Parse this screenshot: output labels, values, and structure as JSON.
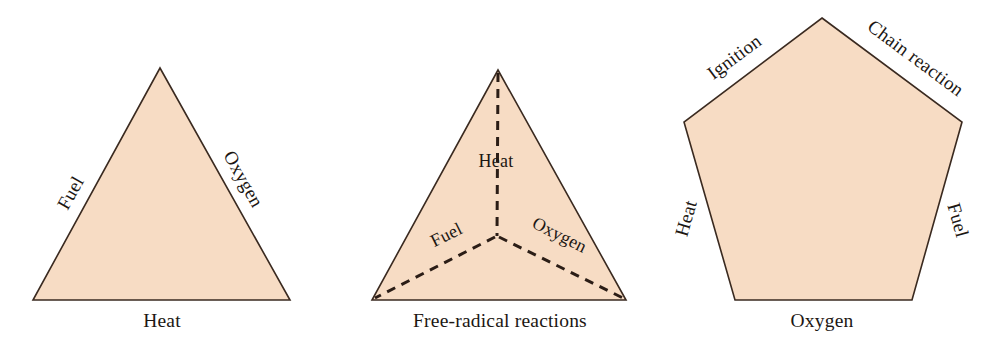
{
  "figure": {
    "background_color": "#ffffff",
    "shape_fill_color": "#f7dcc4",
    "shape_stroke_color": "#3a2a20",
    "label_text_color": "#1c1713",
    "dash_stroke_color": "#2b1d16"
  },
  "diagrams": [
    {
      "id": "fire-triangle",
      "shape": "triangle",
      "labels": {
        "left_edge": "Fuel",
        "right_edge": "Oxygen",
        "bottom": "Heat"
      }
    },
    {
      "id": "fire-tetrahedron",
      "shape": "triangle-with-inner-dashes",
      "labels": {
        "top_inner": "Heat",
        "left_inner": "Fuel",
        "right_inner": "Oxygen",
        "bottom": "Free-radical reactions"
      }
    },
    {
      "id": "fire-pentagon",
      "shape": "pentagon",
      "labels": {
        "upper_left_edge": "Ignition",
        "upper_right_edge": "Chain reaction",
        "lower_left_edge": "Heat",
        "lower_right_edge": "Fuel",
        "bottom": "Oxygen"
      }
    }
  ]
}
